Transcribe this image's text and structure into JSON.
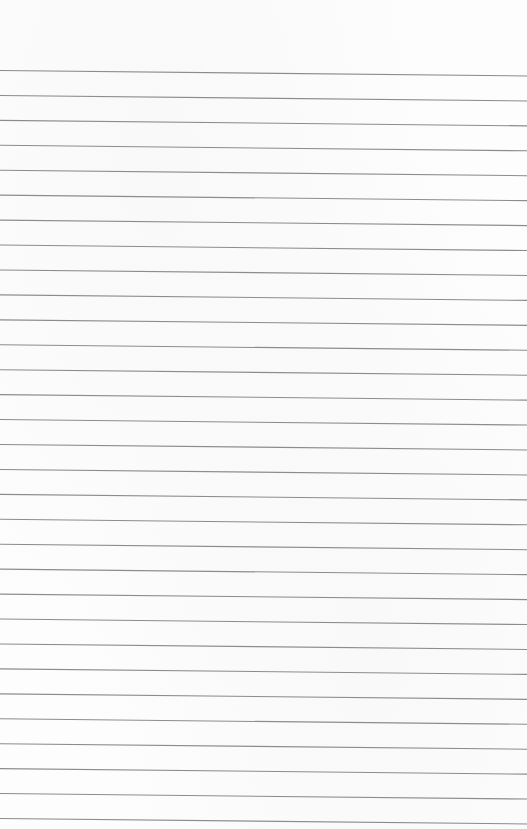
{
  "document": {
    "type": "lined-paper",
    "title": "",
    "rule_count": 31,
    "colors": {
      "paper": "#fdfdfd",
      "rule": "#8c8c8c"
    },
    "content_text": []
  }
}
